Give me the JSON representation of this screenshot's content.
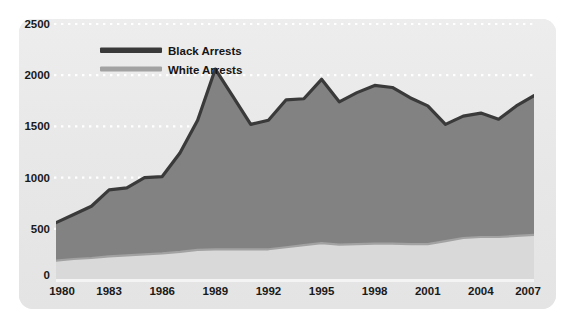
{
  "chart_data": {
    "type": "area",
    "title": "",
    "subtitle": "",
    "xlabel": "",
    "ylabel": "",
    "stacked": false,
    "grid": true,
    "grid_style": "dotted-white-horizontal",
    "legend_position": "top-left-inside",
    "xlim": [
      1980,
      2007
    ],
    "ylim": [
      0,
      2500
    ],
    "yticks": [
      0,
      500,
      1000,
      1500,
      2000,
      2500
    ],
    "ytick_labels": [
      "0",
      "500",
      "1000",
      "1500",
      "2000",
      "2500"
    ],
    "xticks": [
      1980,
      1983,
      1986,
      1989,
      1992,
      1995,
      1998,
      2001,
      2004,
      2007
    ],
    "xtick_labels": [
      "1980",
      "1983",
      "1986",
      "1989",
      "1992",
      "1995",
      "1998",
      "2001",
      "2004",
      "2007"
    ],
    "x": [
      1980,
      1981,
      1982,
      1983,
      1984,
      1985,
      1986,
      1987,
      1988,
      1989,
      1990,
      1991,
      1992,
      1993,
      1994,
      1995,
      1996,
      1997,
      1998,
      1999,
      2000,
      2001,
      2002,
      2003,
      2004,
      2005,
      2006,
      2007
    ],
    "series": [
      {
        "name": "Black Arrests",
        "line_color": "#3a3a3a",
        "fill_color": "#828282",
        "values": [
          560,
          640,
          720,
          880,
          900,
          1000,
          1010,
          1240,
          1560,
          2060,
          1790,
          1520,
          1560,
          1760,
          1770,
          1960,
          1740,
          1830,
          1900,
          1880,
          1780,
          1700,
          1520,
          1600,
          1630,
          1570,
          1700,
          1800
        ]
      },
      {
        "name": "White Arrests",
        "line_color": "#a2a2a2",
        "fill_color": "#d9d9d9",
        "values": [
          190,
          205,
          215,
          230,
          240,
          250,
          260,
          275,
          295,
          300,
          300,
          300,
          300,
          320,
          340,
          360,
          345,
          350,
          355,
          355,
          350,
          350,
          380,
          410,
          420,
          420,
          430,
          440
        ]
      }
    ]
  },
  "legend": {
    "items": [
      {
        "label": "Black Arrests",
        "swatch_color": "#3a3a3a"
      },
      {
        "label": "White Arrests",
        "swatch_color": "#a2a2a2"
      }
    ]
  },
  "colors": {
    "page_background": "#ffffff",
    "panel_background": "#e9e9e9",
    "gridline": "#ffffff",
    "axis_text": "#1a1a1a",
    "baseline": "#f2f2f2"
  }
}
